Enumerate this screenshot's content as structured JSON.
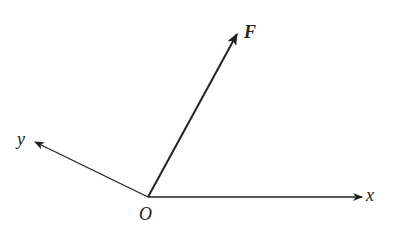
{
  "diagram": {
    "title": "",
    "origin_label": "O",
    "x_axis_label": "x",
    "y_axis_label": "y",
    "force_label": "F",
    "stroke_color": "#222222",
    "background_color": "#fefefe"
  }
}
